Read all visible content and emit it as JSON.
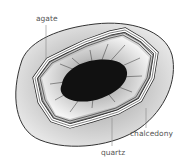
{
  "diagram": {
    "labels": {
      "agate": "agate",
      "chalcedony": "chalcedony",
      "quartz": "quartz"
    },
    "colors": {
      "outer_rock": "#d9d9d9",
      "outline": "#333333",
      "bands": "#ffffff",
      "cavity": "#f0f0f0",
      "crystal_core": "#111111",
      "label_text": "#555555",
      "leader_line": "#888888"
    }
  }
}
